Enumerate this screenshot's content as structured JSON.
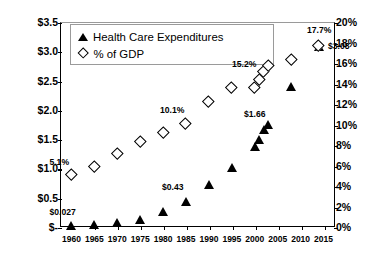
{
  "chart_data": {
    "type": "scatter",
    "title": "",
    "xlabel": "",
    "ylabel": "Health Care Expenditures (Trillions)",
    "y2label": "% of GDP",
    "xlim": [
      1957.5,
      2017.5
    ],
    "ylim": [
      0,
      3.5
    ],
    "y2lim": [
      0,
      20
    ],
    "grid": false,
    "legend_position": "top-left",
    "x_ticks": [
      "1960",
      "1965",
      "1970",
      "1975",
      "1980",
      "1985",
      "1990",
      "1995",
      "2000",
      "2005",
      "2010",
      "2015"
    ],
    "y_ticks": [
      "$-",
      "$0.5",
      "$1.0",
      "$1.5",
      "$2.0",
      "$2.5",
      "$3.0",
      "$3.5"
    ],
    "y2_ticks": [
      "0%",
      "2%",
      "4%",
      "6%",
      "8%",
      "10%",
      "12%",
      "14%",
      "16%",
      "18%",
      "20%"
    ],
    "series": [
      {
        "name": "Health Care Expenditures",
        "marker": "filled-triangle",
        "axis": "left",
        "units": "trillions USD",
        "x": [
          1960,
          1965,
          1970,
          1975,
          1980,
          1985,
          1990,
          1995,
          2000,
          2001,
          2002,
          2003,
          2008,
          2014
        ],
        "values": [
          0.027,
          0.042,
          0.075,
          0.133,
          0.255,
          0.43,
          0.72,
          1.02,
          1.38,
          1.49,
          1.66,
          1.74,
          2.4,
          3.08
        ]
      },
      {
        "name": "% of GDP",
        "marker": "open-diamond",
        "axis": "right",
        "units": "percent",
        "x": [
          1960,
          1965,
          1970,
          1975,
          1980,
          1985,
          1990,
          1995,
          2000,
          2001,
          2002,
          2003,
          2008,
          2014
        ],
        "values": [
          5.1,
          5.9,
          7.2,
          8.3,
          9.2,
          10.1,
          12.2,
          13.6,
          13.6,
          14.4,
          15.2,
          15.7,
          16.3,
          17.7
        ]
      }
    ],
    "annotations": [
      {
        "text": "$0.027",
        "series": "Health Care Expenditures",
        "x": 1960,
        "value": 0.027
      },
      {
        "text": "$0.43",
        "series": "Health Care Expenditures",
        "x": 1985,
        "value": 0.43
      },
      {
        "text": "$1.66",
        "series": "Health Care Expenditures",
        "x": 2002,
        "value": 1.66
      },
      {
        "text": "$3.08",
        "series": "Health Care Expenditures",
        "x": 2014,
        "value": 3.08
      },
      {
        "text": "5.1%",
        "series": "% of GDP",
        "x": 1960,
        "value": 5.1
      },
      {
        "text": "10.1%",
        "series": "% of GDP",
        "x": 1985,
        "value": 10.1
      },
      {
        "text": "15.2%",
        "series": "% of GDP",
        "x": 2002,
        "value": 15.2
      },
      {
        "text": "17.7%",
        "series": "% of GDP",
        "x": 2014,
        "value": 17.7
      }
    ]
  },
  "legend": {
    "entries": [
      {
        "label": "Health Care Expenditures",
        "marker": "filled-triangle"
      },
      {
        "label": "% of GDP",
        "marker": "open-diamond"
      }
    ]
  },
  "colors": {
    "marker": "#000000",
    "axis": "#000000",
    "plot_border_light": "#9a9a9a",
    "background": "#ffffff"
  }
}
